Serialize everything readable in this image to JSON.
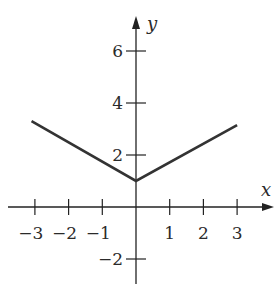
{
  "chart_data": {
    "type": "line",
    "title": "",
    "xlabel": "x",
    "ylabel": "y",
    "xlim": [
      -3.8,
      4.0
    ],
    "ylim": [
      -2.9,
      7.5
    ],
    "grid": false,
    "x_ticks": [
      -3,
      -2,
      -1,
      1,
      2,
      3
    ],
    "x_tick_labels": [
      "−3",
      "−2",
      "−1",
      "1",
      "2",
      "3"
    ],
    "y_ticks": [
      -2,
      2,
      4,
      6
    ],
    "y_tick_labels": [
      "−2",
      "2",
      "4",
      "6"
    ],
    "series": [
      {
        "name": "graph",
        "x": [
          -3.1,
          0,
          3.0
        ],
        "y": [
          3.3,
          1.0,
          3.15
        ]
      }
    ],
    "line_color": "#333333",
    "axis_color": "#222222"
  }
}
